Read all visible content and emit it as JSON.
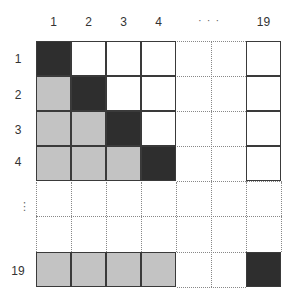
{
  "diagram": {
    "title": "",
    "column_labels": [
      "1",
      "2",
      "3",
      "4",
      "19"
    ],
    "row_labels": [
      "1",
      "2",
      "3",
      "4",
      "19"
    ],
    "horizontal_ellipsis": "· · ·",
    "vertical_ellipsis": "⋮",
    "legend": {
      "black": "diagonal (i = j)",
      "gray": "lower triangle (i > j)",
      "white": "upper triangle (i < j)"
    },
    "colors": {
      "diagonal": "#2e2e2e",
      "lower": "#c3c3c3",
      "upper": "#ffffff",
      "border": "#3a3a3a",
      "dotted": "#888888"
    },
    "matrix_visible": [
      [
        "black",
        "white",
        "white",
        "white",
        "white"
      ],
      [
        "gray",
        "black",
        "white",
        "white",
        "white"
      ],
      [
        "gray",
        "gray",
        "black",
        "white",
        "white"
      ],
      [
        "gray",
        "gray",
        "gray",
        "black",
        "white"
      ],
      [
        "gray",
        "gray",
        "gray",
        "gray",
        "black"
      ]
    ]
  }
}
